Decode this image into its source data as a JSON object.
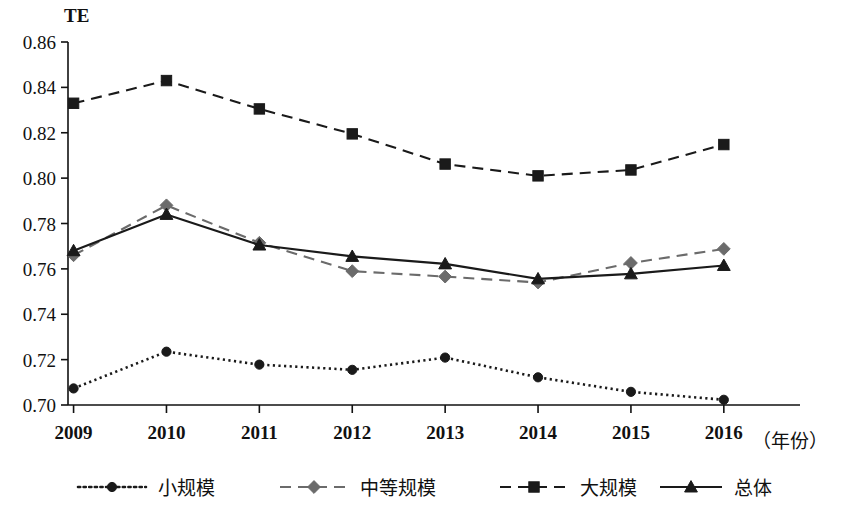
{
  "chart_data": {
    "type": "line",
    "title": "",
    "ylabel": "TE",
    "xlabel": "（年份）",
    "categories": [
      "2009",
      "2010",
      "2011",
      "2012",
      "2013",
      "2014",
      "2015",
      "2016"
    ],
    "x": [
      2009,
      2010,
      2011,
      2012,
      2013,
      2014,
      2015,
      2016
    ],
    "ylim": [
      0.7,
      0.86
    ],
    "yticks": [
      "0.86",
      "0.84",
      "0.82",
      "0.80",
      "0.78",
      "0.76",
      "0.74",
      "0.72",
      "0.70"
    ],
    "ytick_values": [
      0.86,
      0.84,
      0.82,
      0.8,
      0.78,
      0.76,
      0.74,
      0.72,
      0.7
    ],
    "grid": false,
    "legend_position": "bottom",
    "series": [
      {
        "name": "小规模",
        "marker": "circle",
        "dash": "dotted",
        "color": "#1a1a1a",
        "values": [
          0.7073,
          0.7235,
          0.7178,
          0.7155,
          0.7209,
          0.7122,
          0.7058,
          0.7023
        ]
      },
      {
        "name": "中等规模",
        "marker": "diamond",
        "dash": "dashed",
        "color": "#6b6b6b",
        "values": [
          0.766,
          0.788,
          0.7715,
          0.759,
          0.7566,
          0.754,
          0.7626,
          0.7688
        ]
      },
      {
        "name": "大规模",
        "marker": "square",
        "dash": "dashed",
        "color": "#1a1a1a",
        "values": [
          0.833,
          0.843,
          0.8305,
          0.8195,
          0.8062,
          0.801,
          0.8036,
          0.8148
        ]
      },
      {
        "name": "总体",
        "marker": "triangle",
        "dash": "solid",
        "color": "#1a1a1a",
        "values": [
          0.768,
          0.784,
          0.7705,
          0.7655,
          0.7622,
          0.7556,
          0.7578,
          0.7615
        ]
      }
    ]
  },
  "axis": {
    "y_unit": "TE",
    "x_title": "（年份）"
  },
  "legend": {
    "items": [
      {
        "label": "小规模"
      },
      {
        "label": "中等规模"
      },
      {
        "label": "大规模"
      },
      {
        "label": "总体"
      }
    ]
  }
}
